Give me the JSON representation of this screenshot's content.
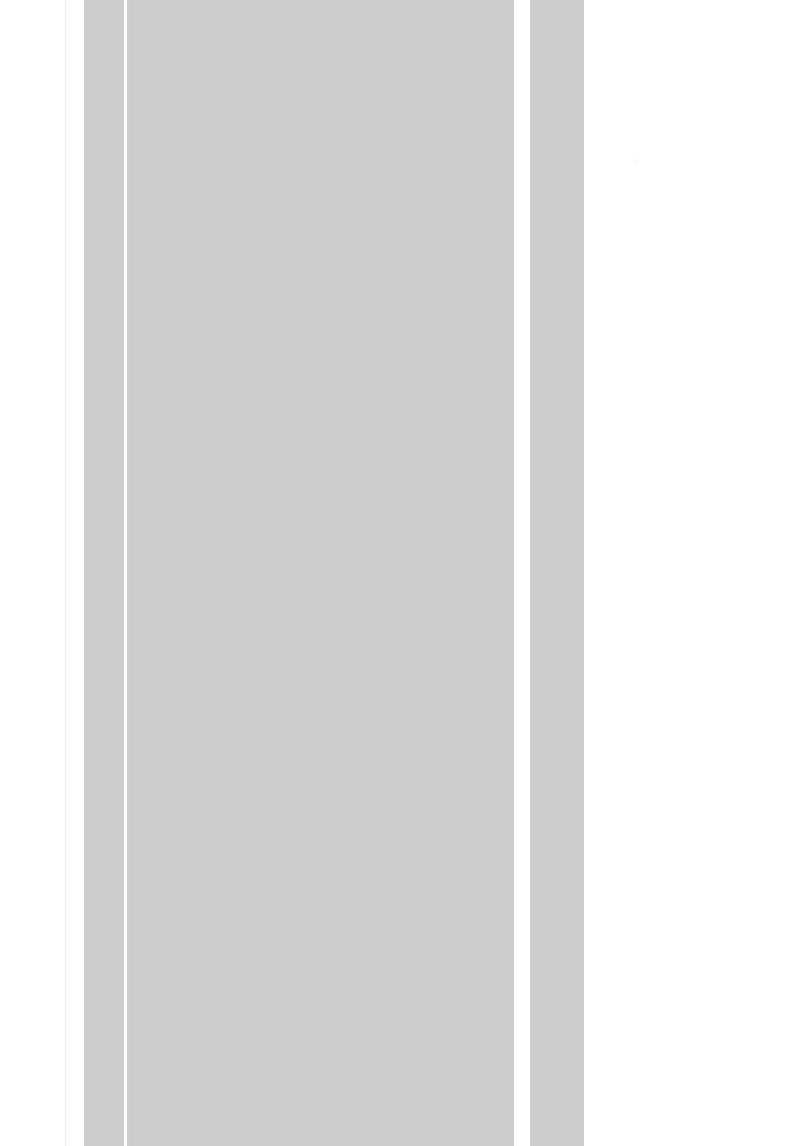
{
  "page": {
    "width": 800,
    "height": 1146,
    "background_color": "#ffffff",
    "state_label": "",
    "content_text": ""
  },
  "theme": {
    "placeholder_gray": "#cdcdcd",
    "hairline_gray": "#ededed",
    "seam_gray": "#d6d6d6",
    "paper_white": "#ffffff"
  },
  "margin_rule": {
    "x": 65,
    "width": 1,
    "color": "#ededed"
  },
  "columns": [
    {
      "name": "narrow-left-column",
      "x": 84,
      "width": 40,
      "color": "#cdcdcd",
      "label": ""
    },
    {
      "name": "main-content-column",
      "x": 127,
      "width": 387,
      "color": "#cdcdcd",
      "label": "",
      "seam_offset": 2
    },
    {
      "name": "right-side-column",
      "x": 530,
      "width": 54,
      "color": "#cdcdcd",
      "label": ""
    }
  ],
  "separators": [
    {
      "name": "left-column-separator",
      "x": 124,
      "width": 3,
      "color": "#ffffff"
    },
    {
      "name": "right-gutter",
      "x": 514,
      "width": 16,
      "color": "#ffffff"
    }
  ],
  "artifact": {
    "x": 636,
    "y": 158,
    "color": "#fafafa"
  }
}
